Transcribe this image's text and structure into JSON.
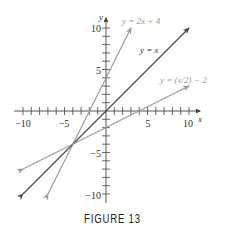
{
  "caption": "FIGURE 13",
  "chart_data": {
    "type": "line",
    "title": "",
    "xlabel": "x",
    "ylabel": "y",
    "xlim": [
      -10,
      10
    ],
    "ylim": [
      -10,
      10
    ],
    "x_ticks": [
      -10,
      -5,
      5,
      10
    ],
    "y_ticks": [
      -10,
      -5,
      5,
      10
    ],
    "tick_step": 1,
    "grid": false,
    "series": [
      {
        "name": "y = 2x + 4",
        "label": "y = 2x + 4",
        "color": "#9a9a9a",
        "x": [
          -7,
          3
        ],
        "y": [
          -10,
          10
        ]
      },
      {
        "name": "y = x",
        "label": "y = x",
        "color": "#4d4d4d",
        "x": [
          -10,
          10
        ],
        "y": [
          -10,
          10
        ]
      },
      {
        "name": "y = (x/2) − 2",
        "label": "y = (x/2) − 2",
        "color": "#9a9a9a",
        "x": [
          -10,
          10
        ],
        "y": [
          -7,
          3
        ]
      }
    ],
    "annotations": [
      "Lines intersect at (-4, -4)"
    ]
  },
  "axes": {
    "x_var": "x",
    "y_var": "y",
    "x_tick_labels": [
      "−10",
      "−5",
      "5",
      "10"
    ],
    "y_tick_labels": [
      "10",
      "5",
      "−5",
      "−10"
    ]
  },
  "labels": {
    "line1": "y = 2x + 4",
    "line2": "y = x",
    "line3": "y = (x/2) − 2"
  }
}
